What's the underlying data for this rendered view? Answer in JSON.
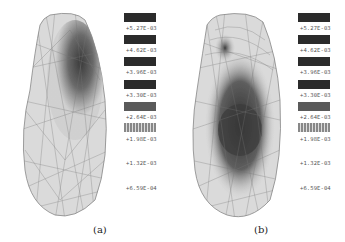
{
  "figure": {
    "panels": [
      {
        "id": "a",
        "caption": "(a)",
        "legend": {
          "labels": [
            "+5.27E-03",
            "+4.62E-03",
            "+3.96E-03",
            "+3.30E-03",
            "+2.64E-03",
            "+1.98E-03",
            "+1.32E-03",
            "+6.59E-04"
          ]
        }
      },
      {
        "id": "b",
        "caption": "(b)",
        "legend": {
          "labels": [
            "+5.27E-03",
            "+4.62E-03",
            "+3.96E-03",
            "+3.30E-03",
            "+2.64E-03",
            "+1.98E-03",
            "+1.32E-03",
            "+6.59E-04"
          ]
        }
      }
    ],
    "colors": {
      "mesh_fill": "#d8d8d8",
      "mesh_line": "#777777",
      "dark_region": "#3a3a3a",
      "legend_swatch": "#2b2b2b"
    }
  }
}
